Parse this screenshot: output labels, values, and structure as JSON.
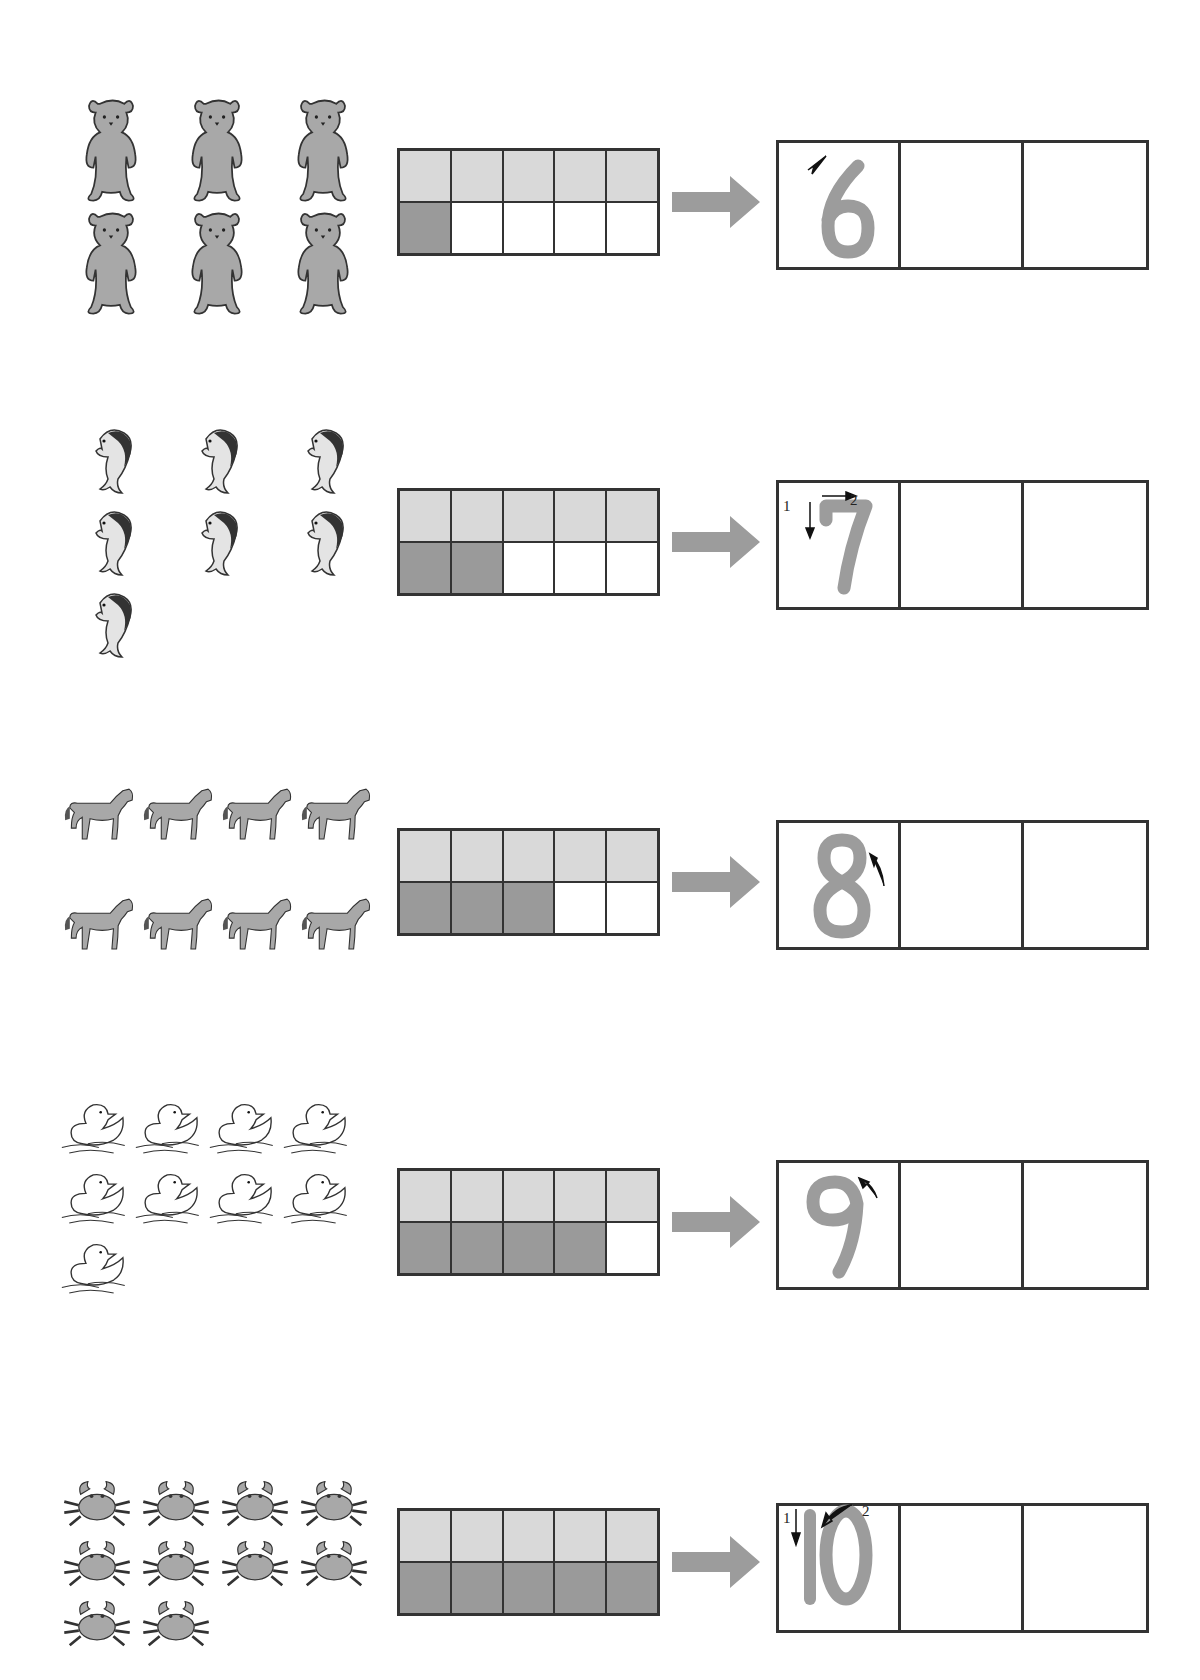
{
  "worksheet": {
    "colors": {
      "top_row": "#d9d9d9",
      "filled": "#9a9a9a",
      "empty": "#ffffff",
      "border": "#333333",
      "trace_digit": "#9c9c9c",
      "arrow": "#9c9c9c"
    },
    "rows": [
      {
        "animal": "bear",
        "count": 6,
        "layout_cols": 3,
        "digit": "6",
        "filled_bottom": 1,
        "stroke_labels": []
      },
      {
        "animal": "dolphin",
        "count": 7,
        "layout_cols": 3,
        "digit": "7",
        "filled_bottom": 2,
        "stroke_labels": [
          "1",
          "2"
        ]
      },
      {
        "animal": "horse",
        "count": 8,
        "layout_cols": 4,
        "digit": "8",
        "filled_bottom": 3,
        "stroke_labels": []
      },
      {
        "animal": "duck",
        "count": 9,
        "layout_cols": 4,
        "digit": "9",
        "filled_bottom": 4,
        "stroke_labels": []
      },
      {
        "animal": "crab",
        "count": 10,
        "layout_cols": 4,
        "digit": "10",
        "filled_bottom": 5,
        "stroke_labels": [
          "1",
          "2"
        ]
      }
    ]
  }
}
